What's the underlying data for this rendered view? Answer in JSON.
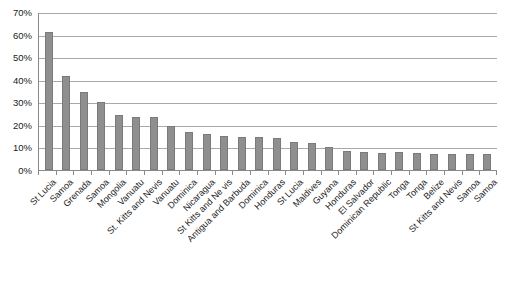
{
  "chart_data": {
    "type": "bar",
    "title": "",
    "subtitle": "",
    "xlabel": "",
    "ylabel": "",
    "ylim": [
      0,
      70
    ],
    "ytick_labels": [
      "70%",
      "60%",
      "50%",
      "40%",
      "30%",
      "20%",
      "10%",
      "0%"
    ],
    "ytick_values": [
      70,
      60,
      50,
      40,
      30,
      20,
      10,
      0
    ],
    "grid": true,
    "legend": false,
    "legend_position": "none",
    "bar_color": "#8f8f8f",
    "categories": [
      "St Lucia",
      "Samoa",
      "Grenada",
      "Samoa",
      "Mongolia",
      "Vanuatu",
      "St. Kitts and Nevis",
      "Vanuatu",
      "Dominica",
      "Nicaragua",
      "St Kitts and Ne vis",
      "Antigua and Barbuda",
      "Dominica",
      "Honduras",
      "St Lucia",
      "Maldives",
      "Guyana",
      "Honduras",
      "El Salvador",
      "Dominican Republic",
      "Tonga",
      "Tonga",
      "Belize",
      "St Kitts and Nevis",
      "Samoa",
      "Samoa"
    ],
    "values": [
      61,
      41.5,
      34.5,
      30,
      24.5,
      23.5,
      23.5,
      19.5,
      17,
      16,
      15,
      14.5,
      14.5,
      14,
      12.5,
      12,
      10,
      8.5,
      8,
      7.5,
      8,
      7.5,
      7,
      7,
      7,
      7
    ]
  }
}
